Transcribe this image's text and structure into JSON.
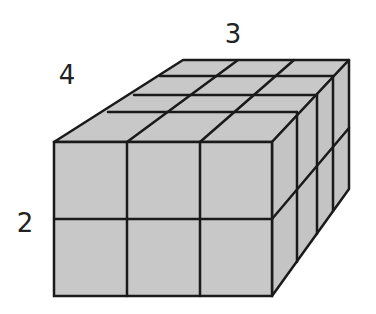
{
  "diagram": {
    "type": "rectangular prism of unit cubes",
    "dimensions": {
      "width": 3,
      "depth": 4,
      "height": 2
    },
    "labels": {
      "width": "3",
      "depth": "4",
      "height": "2"
    },
    "colors": {
      "face": "#c8c8c8",
      "edge": "#1a1a1a",
      "label": "#222222"
    }
  }
}
